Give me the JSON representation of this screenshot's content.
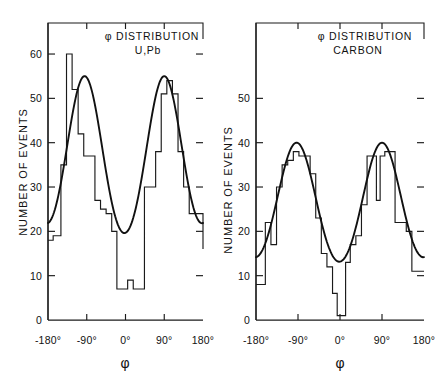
{
  "figure": {
    "width": 443,
    "height": 382,
    "background": "#ffffff",
    "ink_color": "#111111"
  },
  "chart_data": [
    {
      "id": "u-pb",
      "type": "bar",
      "title": "φ DISTRIBUTION",
      "subtitle": "U,Pb",
      "xlabel": "φ",
      "ylabel": "NUMBER OF EVENTS",
      "xlim": [
        -180,
        180
      ],
      "ylim": [
        0,
        67
      ],
      "xticks": [
        -180,
        -90,
        0,
        90,
        180
      ],
      "xtick_labels": [
        "-180°",
        "-90°",
        "0°",
        "90°",
        "180°"
      ],
      "yticks": [
        0,
        10,
        20,
        30,
        40,
        50,
        60
      ],
      "ytick_labels": [
        "0",
        "10",
        "20",
        "30",
        "40",
        "50",
        "60"
      ],
      "grid": false,
      "legend": "none",
      "bin_width": 20,
      "bin_edges": [
        -180,
        -160,
        -140,
        -120,
        -100,
        -80,
        -60,
        -40,
        -20,
        0,
        20,
        40,
        60,
        80,
        100,
        120,
        140,
        160,
        180
      ],
      "values": [
        18,
        19,
        35,
        60,
        52,
        42,
        37,
        27,
        25,
        7,
        9,
        7,
        30,
        38,
        51,
        54,
        51,
        38,
        30,
        24
      ],
      "histogram": {
        "x": [
          -180,
          -168,
          -150,
          -137,
          -124,
          -110,
          -97,
          -84,
          -71,
          -58,
          -45,
          -32,
          -20,
          -8,
          5,
          18,
          31,
          44,
          57,
          70,
          83,
          96,
          109,
          122,
          135,
          148,
          161,
          180
        ],
        "y": [
          18,
          19,
          35,
          60,
          52,
          42,
          37,
          37,
          27,
          25,
          24,
          20,
          7,
          7,
          9,
          7,
          7,
          30,
          30,
          38,
          51,
          54,
          51,
          38,
          30,
          24,
          24,
          16
        ]
      },
      "fit_curve": {
        "description": "smooth double-lobed fit, peaks near -90 and +90",
        "baseline": 12,
        "peak_left": {
          "center": -95,
          "height": 55
        },
        "peak_right": {
          "center": 90,
          "height": 55
        },
        "endpoints": {
          "left": 15,
          "right": 16
        }
      }
    },
    {
      "id": "carbon",
      "type": "bar",
      "title": "φ DISTRIBUTION",
      "subtitle": "CARBON",
      "xlabel": "φ",
      "ylabel": "NUMBER OF EVENTS",
      "xlim": [
        -180,
        180
      ],
      "ylim": [
        0,
        67
      ],
      "xticks": [
        -180,
        -90,
        0,
        90,
        180
      ],
      "xtick_labels": [
        "-180°",
        "-90°",
        "0°",
        "90°",
        "180°"
      ],
      "yticks": [
        0,
        10,
        20,
        30,
        40,
        50
      ],
      "ytick_labels": [
        "0",
        "10",
        "20",
        "30",
        "40",
        "50"
      ],
      "grid": false,
      "legend": "none",
      "bin_width": 20,
      "values": [
        8,
        22,
        17,
        30,
        35,
        36,
        38,
        37,
        33,
        23,
        15,
        12,
        6,
        1,
        1,
        13,
        17,
        19,
        26,
        37,
        27,
        37,
        38,
        22,
        20,
        11
      ],
      "histogram": {
        "x": [
          -180,
          -172,
          -160,
          -148,
          -136,
          -124,
          -112,
          -100,
          -88,
          -76,
          -64,
          -52,
          -40,
          -28,
          -16,
          -6,
          2,
          12,
          22,
          34,
          46,
          58,
          70,
          78,
          86,
          96,
          106,
          118,
          130,
          142,
          154,
          166,
          180
        ],
        "y": [
          8,
          8,
          22,
          17,
          30,
          35,
          36,
          38,
          37,
          37,
          33,
          23,
          15,
          12,
          6,
          1,
          1,
          13,
          17,
          19,
          26,
          37,
          37,
          27,
          37,
          38,
          38,
          22,
          22,
          20,
          11,
          11,
          11
        ]
      },
      "fit_curve": {
        "description": "smooth double-lobed fit, peaks near -90 and +90",
        "baseline": 7,
        "peak_left": {
          "center": -93,
          "height": 40
        },
        "peak_right": {
          "center": 90,
          "height": 40
        },
        "endpoints": {
          "left": 8,
          "right": 8
        }
      }
    }
  ]
}
